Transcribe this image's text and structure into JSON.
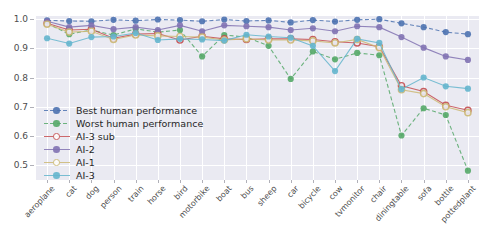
{
  "chart_data": {
    "type": "line",
    "title": "",
    "xlabel": "",
    "ylabel": "",
    "ylim": [
      0.45,
      1.01
    ],
    "yticks": [
      0.5,
      0.6,
      0.7,
      0.8,
      0.9,
      1.0
    ],
    "ytick_labels": [
      "0.5",
      "0.6",
      "0.7",
      "0.8",
      "0.9",
      "1.0"
    ],
    "grid": true,
    "legend_position": "lower left",
    "categories": [
      "aeroplane",
      "cat",
      "dog",
      "person",
      "train",
      "horse",
      "bird",
      "motorbike",
      "boat",
      "bus",
      "sheep",
      "car",
      "bicycle",
      "cow",
      "tvmonitor",
      "chair",
      "diningtable",
      "sofa",
      "bottle",
      "pottedplant"
    ],
    "series": [
      {
        "name": "Best human performance",
        "color": "#4c72b0",
        "linestyle": "dashed",
        "marker": "filled-circle",
        "values": [
          0.995,
          0.993,
          0.992,
          0.997,
          0.994,
          0.998,
          0.996,
          0.992,
          0.998,
          0.993,
          0.995,
          0.988,
          0.996,
          0.991,
          0.997,
          0.999,
          0.985,
          0.972,
          0.955,
          0.948
        ]
      },
      {
        "name": "Worst human performance",
        "color": "#55a868",
        "linestyle": "dashed",
        "marker": "filled-circle",
        "values": [
          0.985,
          0.948,
          0.962,
          0.945,
          0.966,
          0.955,
          0.962,
          0.872,
          0.945,
          0.938,
          0.908,
          0.795,
          0.889,
          0.862,
          0.884,
          0.876,
          0.602,
          0.695,
          0.672,
          0.482
        ]
      },
      {
        "name": "AI-3 sub",
        "color": "#c44e52",
        "linestyle": "solid",
        "marker": "open-circle",
        "values": [
          0.985,
          0.962,
          0.965,
          0.934,
          0.948,
          0.95,
          0.928,
          0.941,
          0.932,
          0.93,
          0.932,
          0.932,
          0.93,
          0.922,
          0.918,
          0.905,
          0.772,
          0.752,
          0.705,
          0.688
        ]
      },
      {
        "name": "AI-2",
        "color": "#8172b2",
        "linestyle": "solid",
        "marker": "filled-circle",
        "values": [
          0.992,
          0.972,
          0.978,
          0.965,
          0.972,
          0.962,
          0.978,
          0.958,
          0.978,
          0.975,
          0.972,
          0.962,
          0.968,
          0.958,
          0.975,
          0.972,
          0.938,
          0.902,
          0.872,
          0.86
        ]
      },
      {
        "name": "AI-1",
        "color": "#ccb974",
        "linestyle": "solid",
        "marker": "open-circle",
        "values": [
          0.982,
          0.955,
          0.958,
          0.93,
          0.945,
          0.942,
          0.94,
          0.938,
          0.928,
          0.932,
          0.928,
          0.928,
          0.925,
          0.918,
          0.93,
          0.902,
          0.758,
          0.745,
          0.7,
          0.68
        ]
      },
      {
        "name": "AI-3",
        "color": "#64b5cd",
        "linestyle": "solid",
        "marker": "filled-circle",
        "values": [
          0.934,
          0.916,
          0.938,
          0.94,
          0.952,
          0.928,
          0.932,
          0.93,
          0.926,
          0.946,
          0.94,
          0.936,
          0.908,
          0.822,
          0.932,
          0.918,
          0.76,
          0.8,
          0.77,
          0.762
        ]
      }
    ]
  }
}
